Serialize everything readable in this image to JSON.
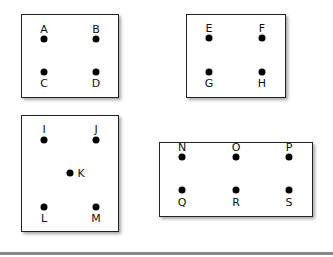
{
  "diagram": {
    "groups": [
      {
        "name": "group-1",
        "box": {
          "x": 21,
          "y": 14,
          "w": 98,
          "h": 84
        },
        "points": [
          {
            "label": "A",
            "x": 44,
            "y": 39,
            "lx": 44,
            "ly": 29
          },
          {
            "label": "B",
            "x": 96,
            "y": 39,
            "lx": 96,
            "ly": 29
          },
          {
            "label": "C",
            "x": 44,
            "y": 72,
            "lx": 44,
            "ly": 83
          },
          {
            "label": "D",
            "x": 96,
            "y": 72,
            "lx": 96,
            "ly": 83
          }
        ]
      },
      {
        "name": "group-2",
        "box": {
          "x": 186,
          "y": 14,
          "w": 100,
          "h": 84
        },
        "points": [
          {
            "label": "E",
            "x": 209,
            "y": 38,
            "lx": 209,
            "ly": 28
          },
          {
            "label": "F",
            "x": 262,
            "y": 38,
            "lx": 262,
            "ly": 28
          },
          {
            "label": "G",
            "x": 209,
            "y": 72,
            "lx": 209,
            "ly": 83
          },
          {
            "label": "H",
            "x": 262,
            "y": 72,
            "lx": 262,
            "ly": 83
          }
        ]
      },
      {
        "name": "group-3",
        "box": {
          "x": 21,
          "y": 115,
          "w": 98,
          "h": 117
        },
        "points": [
          {
            "label": "I",
            "x": 44,
            "y": 140,
            "lx": 44,
            "ly": 129
          },
          {
            "label": "J",
            "x": 96,
            "y": 140,
            "lx": 96,
            "ly": 129
          },
          {
            "label": "K",
            "x": 70,
            "y": 173,
            "lx": 81,
            "ly": 173
          },
          {
            "label": "L",
            "x": 44,
            "y": 207,
            "lx": 44,
            "ly": 218
          },
          {
            "label": "M",
            "x": 96,
            "y": 207,
            "lx": 96,
            "ly": 218
          }
        ]
      },
      {
        "name": "group-4",
        "box": {
          "x": 159,
          "y": 142,
          "w": 154,
          "h": 75
        },
        "points": [
          {
            "label": "N",
            "x": 182,
            "y": 157,
            "lx": 182,
            "ly": 147
          },
          {
            "label": "O",
            "x": 236,
            "y": 157,
            "lx": 236,
            "ly": 147
          },
          {
            "label": "P",
            "x": 289,
            "y": 157,
            "lx": 289,
            "ly": 147
          },
          {
            "label": "Q",
            "x": 182,
            "y": 190,
            "lx": 182,
            "ly": 202
          },
          {
            "label": "R",
            "x": 236,
            "y": 190,
            "lx": 236,
            "ly": 202
          },
          {
            "label": "S",
            "x": 289,
            "y": 190,
            "lx": 289,
            "ly": 202
          }
        ]
      }
    ]
  }
}
